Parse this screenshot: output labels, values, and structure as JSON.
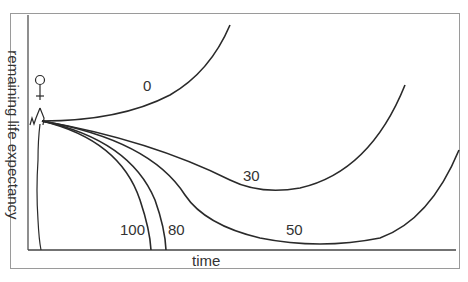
{
  "diagram": {
    "y_axis_label": "remaining life expectancy",
    "x_axis_label": "time",
    "curve_labels": {
      "c0": "0",
      "c30": "30",
      "c50": "50",
      "c80": "80",
      "c100": "100"
    },
    "figure_icon": "stick-figure-icon",
    "colors": {
      "line": "#2a2a2a",
      "frame": "#9a9a9a",
      "text": "#333333"
    }
  }
}
